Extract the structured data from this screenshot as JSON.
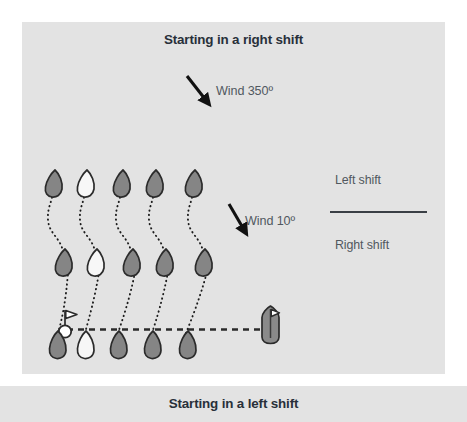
{
  "figure": {
    "type": "sailing-tactics-diagram",
    "caption_top": "Starting in a right shift",
    "caption_bottom": "Starting in a left shift",
    "background_color": "#e3e3e3",
    "page_color": "#ffffff"
  },
  "wind": {
    "upper": {
      "label": "Wind 350º",
      "direction_degrees": 350,
      "arrow": "down-right-arrow"
    },
    "lower": {
      "label": "Wind 10º",
      "direction_degrees": 10,
      "arrow": "down-right-arrow"
    }
  },
  "legend": {
    "above_line": "Left shift",
    "below_line": "Right shift",
    "divider_color": "#3a3f45"
  },
  "marks": {
    "pin_buoy": {
      "name": "pin-end-buoy",
      "fill": "#ffffff"
    },
    "committee_boat": {
      "name": "committee-boat",
      "fill": "#8a8a8a",
      "flag": "white-triangular-flag"
    },
    "start_line": {
      "name": "start-line",
      "style": "dashed",
      "color": "#2b2b2b"
    }
  },
  "fleet": {
    "hull_fill_gray": "#858585",
    "hull_fill_white": "#f7f7f7",
    "hull_outline": "#2b2b2b",
    "track_color": "#1c1c1c",
    "track_style": "dotted",
    "rows": [
      {
        "name": "start-row",
        "boat_fills": [
          "gray",
          "white",
          "gray",
          "gray",
          "gray"
        ]
      },
      {
        "name": "middle-row",
        "boat_fills": [
          "gray",
          "white",
          "gray",
          "gray",
          "gray"
        ]
      },
      {
        "name": "top-row",
        "boat_fills": [
          "gray",
          "white",
          "gray",
          "gray",
          "gray"
        ]
      }
    ]
  }
}
